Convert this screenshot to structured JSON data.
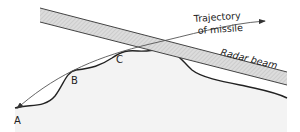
{
  "diagram": {
    "labels": {
      "point_a": "A",
      "point_b": "B",
      "point_c": "C",
      "trajectory_line1": "Trajectory",
      "trajectory_line2": "of missile",
      "radar_beam": "Radar beam"
    },
    "colors": {
      "terrain_fill": "#f1f1f1",
      "terrain_line": "#222222",
      "beam_fill": "#d6d6d6",
      "beam_edge": "#444444",
      "trajectory": "#555555"
    }
  }
}
